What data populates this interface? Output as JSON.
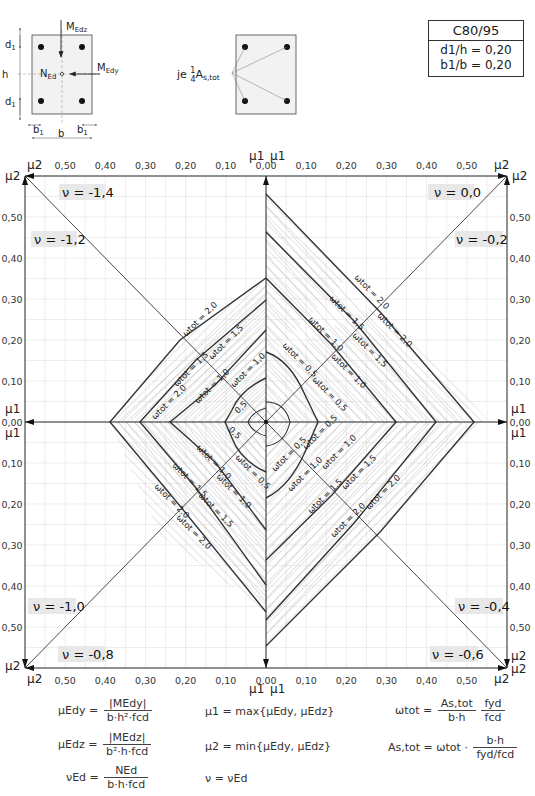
{
  "header": {
    "material_box": {
      "concrete_class": "C80/95",
      "ratio_d1_h": "d1/h = 0,20",
      "ratio_b1_b": "b1/b = 0,20"
    },
    "section_sketch": {
      "labels": [
        "MEdz",
        "NEd",
        "MEdy",
        "d1",
        "h",
        "d1",
        "b1",
        "b1",
        "b"
      ]
    },
    "reinforcement_note": "je 1/4 As,tot"
  },
  "chart_data": {
    "type": "line",
    "subtitle": "C80/95, d1/h = 0,20, b1/b = 0,20",
    "xlabel": "μ1",
    "ylabel": "μ2",
    "axis_range": [
      0.0,
      0.6
    ],
    "tick_step": 0.1,
    "x_ticks": [
      "0,50",
      "0,40",
      "0,30",
      "0,20",
      "0,10",
      "0,00",
      "0,10",
      "0,20",
      "0,30",
      "0,40",
      "0,50"
    ],
    "y_ticks": [
      "0,50",
      "0,40",
      "0,30",
      "0,20",
      "0,10",
      "0,00",
      "0,10",
      "0,20",
      "0,30",
      "0,40",
      "0,50"
    ],
    "grid": true,
    "quadrants": [
      {
        "position": "top-left",
        "nu_labels": [
          "ν = -1,4",
          "ν = -1,2"
        ]
      },
      {
        "position": "top-right",
        "nu_labels": [
          "ν = 0,0",
          "ν = -0,2"
        ]
      },
      {
        "position": "bottom-left",
        "nu_labels": [
          "ν = -1,0",
          "ν = -0,8"
        ]
      },
      {
        "position": "bottom-right",
        "nu_labels": [
          "ν = -0,4",
          "ν = -0,6"
        ]
      }
    ],
    "omega_tot_curves": [
      0.5,
      1.0,
      1.5,
      2.0
    ],
    "series": [
      {
        "name": "ν=0,0 ω=2,0",
        "mu1_at_mu2_0": 0.345,
        "mu2_at_mu1_0": 0.55
      },
      {
        "name": "ν=-0,2 ω=2,0",
        "mu1_at_mu2_0": 0.52,
        "mu2_at_mu1_0": 0.35
      },
      {
        "name": "ν=-1,4 ω=2,0",
        "mu1_at_mu2_0": 0.385,
        "mu2_at_mu1_0": 0.35
      },
      {
        "name": "ν=-1,0 ω=2,0",
        "mu1_at_mu2_0": 0.385,
        "mu2_at_mu1_0": 0.46
      },
      {
        "name": "ν=-0,4 ω=2,0",
        "mu1_at_mu2_0": 0.52,
        "mu2_at_mu1_0": 0.52
      }
    ],
    "curve_labels": {
      "w20": "ωtot = 2,0",
      "w15": "ωtot = 1,5",
      "w10": "ωtot = 1,0",
      "w05": "ωtot = 0,5",
      "short05": "0,5"
    },
    "axis_names": {
      "mu1": "μ1",
      "mu2": "μ2",
      "zero": "0,00"
    }
  },
  "formulas": {
    "mu_edy": {
      "lhs": "μEdy =",
      "num": "|MEdy|",
      "den": "b·h²·fcd"
    },
    "mu_edz": {
      "lhs": "μEdz =",
      "num": "|MEdz|",
      "den": "b²·h·fcd"
    },
    "nu_ed": {
      "lhs": "νEd =",
      "num": "NEd",
      "den": "b·h·fcd"
    },
    "mu1": "μ1 = max{μEdy, μEdz}",
    "mu2": "μ2 = min{μEdy, μEdz}",
    "nu": "ν = νEd",
    "omega_tot": {
      "lhs": "ωtot =",
      "num1": "As,tot",
      "den1": "b·h",
      "num2": "fyd",
      "den2": "fcd"
    },
    "as_tot": {
      "lhs": "As,tot = ωtot ·",
      "num": "b·h",
      "den": "fyd/fcd"
    }
  }
}
